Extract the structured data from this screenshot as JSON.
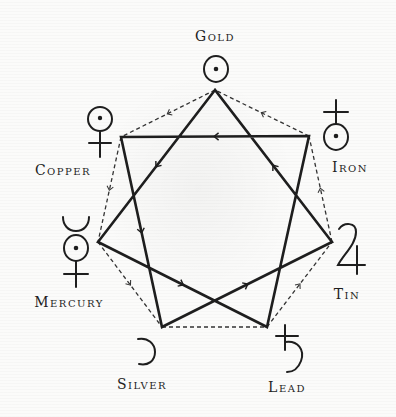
{
  "diagram": {
    "type": "heptagram",
    "colors": {
      "background": "#fbfbfa",
      "ink": "#1e1e1e",
      "dashed": "#333333"
    },
    "nodes": [
      {
        "id": "gold",
        "label": "Gold",
        "symbol": "sun-symbol",
        "x": 215,
        "y": 90
      },
      {
        "id": "iron",
        "label": "Iron",
        "symbol": "mars-iron-symbol",
        "x": 309,
        "y": 136
      },
      {
        "id": "tin",
        "label": "Tin",
        "symbol": "jupiter-symbol",
        "x": 332,
        "y": 242
      },
      {
        "id": "lead",
        "label": "Lead",
        "symbol": "saturn-symbol",
        "x": 267,
        "y": 327
      },
      {
        "id": "silver",
        "label": "Silver",
        "symbol": "moon-symbol",
        "x": 162,
        "y": 327
      },
      {
        "id": "mercury",
        "label": "Mercury",
        "symbol": "mercury-symbol",
        "x": 98,
        "y": 242
      },
      {
        "id": "copper",
        "label": "Copper",
        "symbol": "venus-symbol",
        "x": 121,
        "y": 137
      }
    ],
    "star_edges": [
      {
        "from": "tin",
        "to": "gold",
        "arrow": true
      },
      {
        "from": "gold",
        "to": "mercury",
        "arrow": true
      },
      {
        "from": "mercury",
        "to": "lead",
        "arrow": true
      },
      {
        "from": "lead",
        "to": "iron",
        "arrow": false
      },
      {
        "from": "iron",
        "to": "copper",
        "arrow": true
      },
      {
        "from": "copper",
        "to": "silver",
        "arrow": true
      },
      {
        "from": "silver",
        "to": "tin",
        "arrow": true
      }
    ],
    "heptagon_edges": [
      {
        "from": "iron",
        "to": "gold",
        "arrow": true
      },
      {
        "from": "gold",
        "to": "copper",
        "arrow": true
      },
      {
        "from": "copper",
        "to": "mercury",
        "arrow": true
      },
      {
        "from": "mercury",
        "to": "silver",
        "arrow": true
      },
      {
        "from": "silver",
        "to": "lead",
        "arrow": false
      },
      {
        "from": "lead",
        "to": "tin",
        "arrow": true
      },
      {
        "from": "tin",
        "to": "iron",
        "arrow": true
      }
    ]
  },
  "labels": {
    "gold": "Gold",
    "iron": "Iron",
    "tin": "Tin",
    "lead": "Lead",
    "silver": "Silver",
    "mercury": "Mercury",
    "copper": "Copper"
  }
}
